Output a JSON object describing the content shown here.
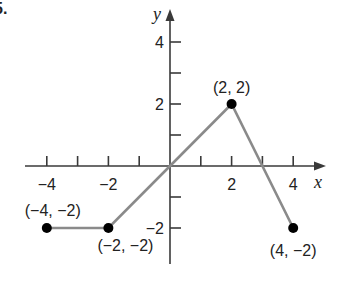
{
  "figure": {
    "problem_marker": "5."
  },
  "chart_data": {
    "type": "line",
    "title": "",
    "xlabel": "x",
    "ylabel": "y",
    "xlim": [
      -4.5,
      5
    ],
    "ylim": [
      -3,
      5
    ],
    "grid": false,
    "legend": null,
    "x_ticks": [
      -4,
      -3,
      -2,
      -1,
      1,
      2,
      3,
      4
    ],
    "x_tick_labels": [
      {
        "value": -4,
        "label": "−4"
      },
      {
        "value": -2,
        "label": "−2"
      },
      {
        "value": 2,
        "label": "2"
      },
      {
        "value": 4,
        "label": "4"
      }
    ],
    "y_ticks": [
      -2,
      -1,
      1,
      2,
      3,
      4
    ],
    "y_tick_labels": [
      {
        "value": 4,
        "label": "4"
      },
      {
        "value": 2,
        "label": "2"
      },
      {
        "value": -2,
        "label": "−2"
      }
    ],
    "series": [
      {
        "name": "piecewise f(x)",
        "x": [
          -4,
          -2,
          0,
          2,
          4
        ],
        "y": [
          -2,
          -2,
          0,
          2,
          -2
        ],
        "color": "#8a8a8a"
      }
    ],
    "marked_points": [
      {
        "x": -4,
        "y": -2,
        "label": "(−4, −2)"
      },
      {
        "x": -2,
        "y": -2,
        "label": "(−2, −2)"
      },
      {
        "x": 2,
        "y": 2,
        "label": "(2, 2)"
      },
      {
        "x": 4,
        "y": -2,
        "label": "(4, −2)"
      }
    ],
    "colors": {
      "axis": "#3a3a3a",
      "line": "#8a8a8a",
      "point": "#000000",
      "text": "#222222"
    }
  }
}
